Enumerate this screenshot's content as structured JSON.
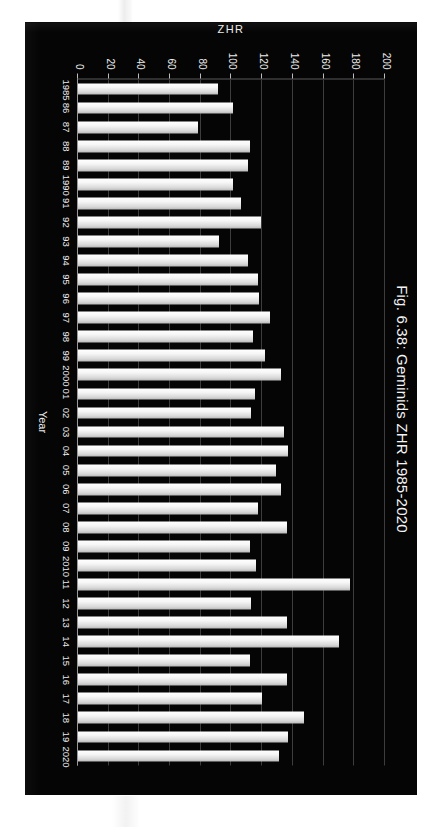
{
  "figure": {
    "title": "Fig. 6.38: Geminids ZHR 1985-2020",
    "panel_background": "#050505",
    "bar_color": "#ffffff",
    "grid_color": "#3d3d3d",
    "text_color": "#f2f2f2"
  },
  "chart_data": {
    "type": "bar",
    "orientation": "horizontal",
    "title": "Fig. 6.38: Geminids ZHR 1985-2020",
    "xlabel": "Year",
    "ylabel": "ZHR",
    "ylim": [
      0,
      200
    ],
    "yticks": [
      0,
      20,
      40,
      60,
      80,
      100,
      120,
      140,
      160,
      180,
      200
    ],
    "ytick_labels": [
      "0",
      "20",
      "40",
      "60",
      "80",
      "100",
      "120",
      "140",
      "160",
      "180",
      "200"
    ],
    "grid": true,
    "legend": "none",
    "categories": [
      "1985",
      "86",
      "87",
      "88",
      "89",
      "1990",
      "91",
      "92",
      "93",
      "94",
      "95",
      "96",
      "97",
      "98",
      "99",
      "2000",
      "01",
      "02",
      "03",
      "04",
      "05",
      "06",
      "07",
      "08",
      "09",
      "2010",
      "11",
      "12",
      "13",
      "14",
      "15",
      "16",
      "17",
      "18",
      "19",
      "2020"
    ],
    "x": [
      1985,
      1986,
      1987,
      1988,
      1989,
      1990,
      1991,
      1992,
      1993,
      1994,
      1995,
      1996,
      1997,
      1998,
      1999,
      2000,
      2001,
      2002,
      2003,
      2004,
      2005,
      2006,
      2007,
      2008,
      2009,
      2010,
      2011,
      2012,
      2013,
      2014,
      2015,
      2016,
      2017,
      2018,
      2019,
      2020
    ],
    "values": [
      91,
      101,
      78,
      112,
      111,
      101,
      106,
      119,
      92,
      111,
      117,
      118,
      125,
      114,
      122,
      132,
      115,
      113,
      134,
      137,
      129,
      132,
      117,
      136,
      112,
      116,
      177,
      113,
      136,
      170,
      112,
      136,
      120,
      147,
      137,
      131
    ]
  }
}
